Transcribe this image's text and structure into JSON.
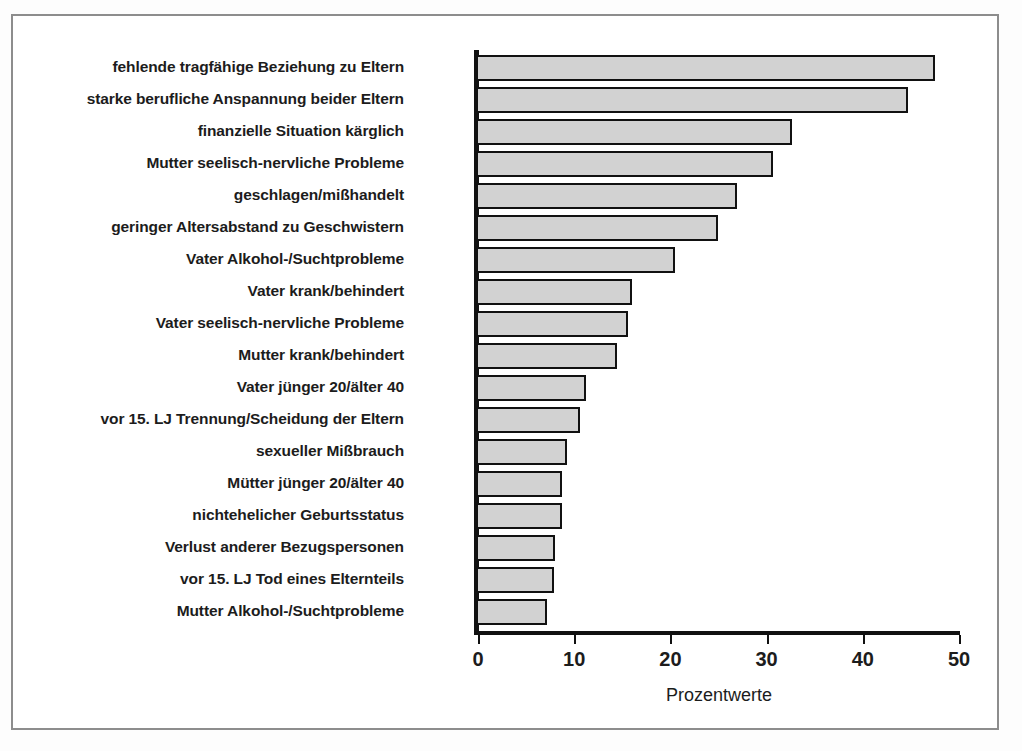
{
  "chart_data": {
    "type": "bar",
    "orientation": "horizontal",
    "title": "",
    "xlabel": "Prozentwerte",
    "ylabel": "",
    "xlim": [
      0,
      52
    ],
    "grid": false,
    "legend": null,
    "xticks": [
      0,
      10,
      20,
      30,
      40,
      50
    ],
    "xtick_labels": [
      "0",
      "10",
      "20",
      "30",
      "40",
      "50"
    ],
    "categories": [
      "fehlende tragfähige Beziehung zu Eltern",
      "starke berufliche Anspannung beider Eltern",
      "finanzielle Situation kärglich",
      "Mutter seelisch-nervliche Probleme",
      "geschlagen/mißhandelt",
      "geringer Altersabstand zu Geschwistern",
      "Vater Alkohol-/Suchtprobleme",
      "Vater krank/behindert",
      "Vater seelisch-nervliche Probleme",
      "Mutter krank/behindert",
      "Vater jünger 20/älter 40",
      "vor 15. LJ Trennung/Scheidung der Eltern",
      "sexueller Mißbrauch",
      "Mütter jünger 20/älter 40",
      "nichtehelicher Geburtsstatus",
      "Verlust anderer Bezugspersonen",
      "vor 15. LJ Tod eines Elternteils",
      "Mutter Alkohol-/Suchtprobleme"
    ],
    "values": [
      47.5,
      44.7,
      32.6,
      30.7,
      26.9,
      24.9,
      20.5,
      16.0,
      15.6,
      14.5,
      11.2,
      10.6,
      9.3,
      8.7,
      8.7,
      8.0,
      7.9,
      7.2
    ],
    "bar_fill_color": "#d2d2d2",
    "bar_border_color": "#111111"
  }
}
